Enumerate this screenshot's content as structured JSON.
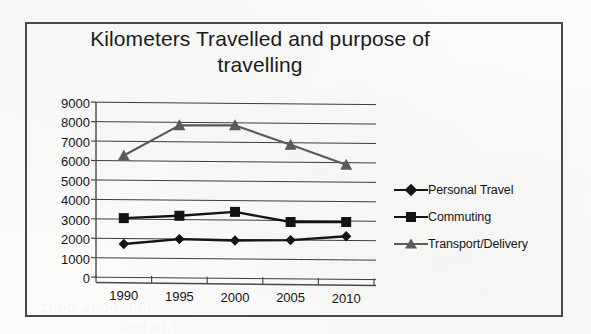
{
  "chart_data": {
    "type": "line",
    "title": "Kilometers Travelled and purpose of travelling",
    "xlabel": "",
    "ylabel": "",
    "categories": [
      "1990",
      "1995",
      "2000",
      "2005",
      "2010"
    ],
    "ylim": [
      0,
      9000
    ],
    "ytick_step": 1000,
    "yticks": [
      "9000",
      "8000",
      "7000",
      "6000",
      "5000",
      "4000",
      "3000",
      "2000",
      "1000",
      "0"
    ],
    "grid": "horizontal",
    "legend_position": "right",
    "series": [
      {
        "name": "Personal Travel",
        "marker": "diamond",
        "color": "#141414",
        "values": [
          1750,
          2000,
          1930,
          1950,
          2150
        ]
      },
      {
        "name": "Commuting",
        "marker": "square",
        "color": "#141414",
        "values": [
          3080,
          3200,
          3400,
          2880,
          2880
        ]
      },
      {
        "name": "Transport/Delivery",
        "marker": "triangle",
        "color": "#5a5a5a",
        "values": [
          6300,
          7850,
          7850,
          6850,
          5820
        ]
      }
    ]
  },
  "legend": {
    "items": [
      {
        "label": "Personal Travel",
        "marker": "diamond-marker-icon"
      },
      {
        "label": "Commuting",
        "marker": "square-marker-icon"
      },
      {
        "label": "Transport/Delivery",
        "marker": "triangle-marker-icon"
      }
    ]
  },
  "colors": {
    "axis": "#4a4a4a",
    "grid": "#3d3d3d",
    "frame": "#4a4a4a",
    "text": "#141414",
    "paper": "#fbfbfa"
  },
  "scan_artifacts": {
    "ghost_text_1": "1000 2000 3000",
    "ghost_text_2": "the  was  in",
    "ghost_text_3": "and  of  to"
  }
}
